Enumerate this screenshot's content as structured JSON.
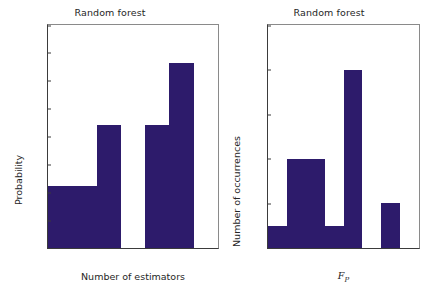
{
  "figure": {
    "background": "#ffffff",
    "bar_color": "#2d1b6b",
    "axis_color": "#3b3b3b"
  },
  "panels": [
    {
      "id": "left",
      "title": "Random forest",
      "xlabel": "Number of estimators",
      "ylabel": "Probability",
      "xticks": [
        "15",
        "20",
        "25",
        "30",
        "35",
        "40",
        "45",
        "50"
      ],
      "yticks": [
        "0.00",
        "0.01",
        "0.02",
        "0.03",
        "0.04",
        "0.05",
        "0.06",
        "0.07",
        "0.08"
      ]
    },
    {
      "id": "right",
      "title": "Random forest",
      "xlabel_main": "F",
      "xlabel_sub": "P",
      "ylabel": "Number of occurrences",
      "xticks": [
        "0.60",
        "0.65",
        "0.70",
        "0.75",
        "0.80",
        "0.85",
        "0.90",
        "0.95",
        "1.00"
      ],
      "yticks": [
        "0",
        "2",
        "4",
        "6",
        "8",
        "10"
      ]
    }
  ],
  "chart_data": [
    {
      "type": "bar",
      "title": "Random forest",
      "xlabel": "Number of estimators",
      "ylabel": "Probability",
      "xlim": [
        15,
        50
      ],
      "ylim": [
        0.0,
        0.08
      ],
      "grid": false,
      "legend": false,
      "bin_edges": [
        15,
        20,
        25,
        30,
        35,
        40,
        45,
        50
      ],
      "categories": [
        "15-20",
        "20-25",
        "25-30",
        "30-35",
        "35-40",
        "40-45",
        "45-50"
      ],
      "values": [
        0.0221,
        0.0221,
        0.0443,
        0.0,
        0.0443,
        0.0664,
        0.0
      ],
      "xtick_values": [
        15,
        20,
        25,
        30,
        35,
        40,
        45,
        50
      ],
      "ytick_values": [
        0.0,
        0.01,
        0.02,
        0.03,
        0.04,
        0.05,
        0.06,
        0.07,
        0.08
      ]
    },
    {
      "type": "bar",
      "title": "Random forest",
      "xlabel": "F_P",
      "ylabel": "Number of occurrences",
      "xlim": [
        0.6,
        1.0
      ],
      "ylim": [
        0,
        10
      ],
      "grid": false,
      "legend": false,
      "bin_edges": [
        0.6,
        0.65,
        0.7,
        0.75,
        0.8,
        0.85,
        0.9,
        0.95,
        1.0
      ],
      "categories": [
        "0.60-0.65",
        "0.65-0.70",
        "0.70-0.75",
        "0.75-0.80",
        "0.80-0.85",
        "0.85-0.90",
        "0.90-0.95",
        "0.95-1.00"
      ],
      "values": [
        1,
        4,
        4,
        1,
        8,
        0,
        2,
        0
      ],
      "xtick_values": [
        0.6,
        0.65,
        0.7,
        0.75,
        0.8,
        0.85,
        0.9,
        0.95,
        1.0
      ],
      "ytick_values": [
        0,
        2,
        4,
        6,
        8,
        10
      ]
    }
  ]
}
